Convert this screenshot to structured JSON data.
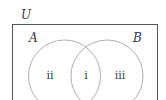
{
  "diagram": {
    "type": "venn",
    "universe_label": "U",
    "sets": [
      {
        "label": "A"
      },
      {
        "label": "B"
      }
    ],
    "regions": {
      "intersection": "i",
      "a_only": "ii",
      "b_only": "iii"
    },
    "colors": {
      "universe_border": "#555555",
      "circle_stroke": "#b0b0b0",
      "text": "#3a3a3a"
    }
  }
}
